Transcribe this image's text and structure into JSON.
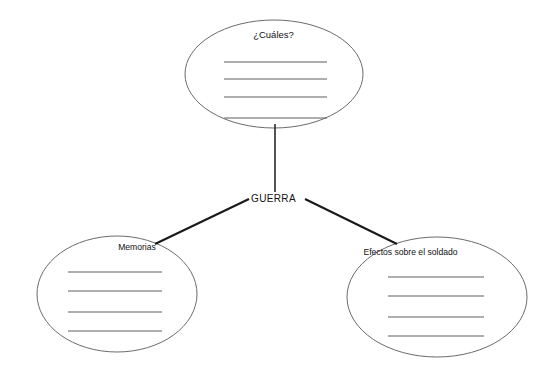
{
  "diagram": {
    "type": "concept-map",
    "title_text": "GUERRA",
    "center_node": {
      "label": "GUERRA",
      "x": 274,
      "y": 199
    },
    "nodes": [
      {
        "id": "cuales",
        "label": "¿Cuáles?",
        "shape": "ellipse",
        "cx": 274,
        "cy": 74,
        "rx": 89,
        "ry": 54,
        "blank_lines": 4,
        "position": "top"
      },
      {
        "id": "memorias",
        "label": "Memorias",
        "shape": "ellipse",
        "cx": 117,
        "cy": 294,
        "rx": 80,
        "ry": 58,
        "blank_lines": 4,
        "position": "bottom-left"
      },
      {
        "id": "efectos",
        "label": "Efectos sobre el soldado",
        "shape": "ellipse",
        "cx": 437,
        "cy": 297,
        "rx": 90,
        "ry": 60,
        "blank_lines": 4,
        "position": "bottom-right"
      }
    ],
    "edges": [
      {
        "from": "GUERRA",
        "to": "cuales",
        "kind": "vertical"
      },
      {
        "from": "GUERRA",
        "to": "memorias",
        "kind": "diagonal"
      },
      {
        "from": "GUERRA",
        "to": "efectos",
        "kind": "diagonal"
      }
    ],
    "colors": {
      "background": "#ffffff",
      "ellipse_stroke": "#6b6b6b",
      "connector_stroke": "#1a1a1a",
      "rule_stroke": "#5e5e5e",
      "text": "#111111"
    }
  }
}
